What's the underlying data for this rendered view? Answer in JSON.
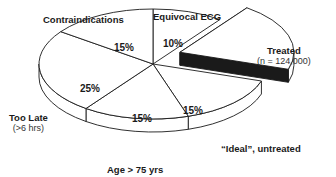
{
  "chart_data": {
    "type": "pie",
    "style": "3d-exploded",
    "title": "",
    "slices": [
      {
        "label": "Equivocal ECG",
        "sublabel": "",
        "value": 10,
        "display": "10%",
        "exploded": false
      },
      {
        "label": "Treated",
        "sublabel": "(n = 124,000)",
        "value": 20,
        "display": "20%",
        "exploded": true
      },
      {
        "label": "“Ideal”, untreated",
        "sublabel": "",
        "value": 15,
        "display": "15%",
        "exploded": false
      },
      {
        "label": "Age > 75 yrs",
        "sublabel": "",
        "value": 15,
        "display": "15%",
        "exploded": false
      },
      {
        "label": "Too Late",
        "sublabel": "(>6 hrs)",
        "value": 25,
        "display": "25%",
        "exploded": false
      },
      {
        "label": "Contraindications",
        "sublabel": "",
        "value": 15,
        "display": "15%",
        "exploded": false
      }
    ],
    "colors": {
      "face": "#ffffff",
      "outline": "#1a1a1a",
      "exploded_side": "#1a1a1a"
    }
  }
}
